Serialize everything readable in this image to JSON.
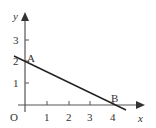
{
  "diagram": {
    "type": "coordinate-graph",
    "axes": {
      "x_label": "x",
      "y_label": "y",
      "origin_label": "O",
      "x_ticks": [
        "1",
        "2",
        "3",
        "4"
      ],
      "y_ticks": [
        "1",
        "2",
        "3"
      ]
    },
    "points": [
      {
        "label": "A",
        "x": 0,
        "y": 2
      },
      {
        "label": "B",
        "x": 4,
        "y": 0
      }
    ],
    "line": {
      "from": "A",
      "to": "B",
      "extended": true
    },
    "colors": {
      "stroke": "#333333",
      "background": "#ffffff"
    }
  }
}
